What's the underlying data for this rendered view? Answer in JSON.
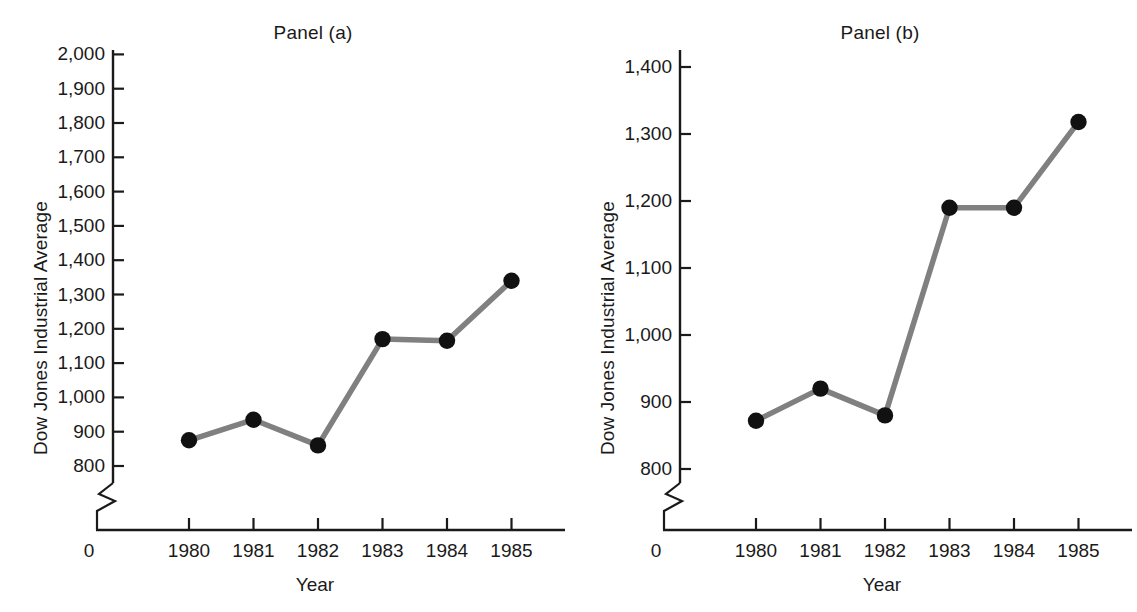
{
  "figure": {
    "background_color": "#ffffff",
    "marker_color": "#111111",
    "line_color": "#808080",
    "axis_color": "#1a1a1a"
  },
  "chart_data": [
    {
      "type": "line",
      "title": "Panel (a)",
      "xlabel": "Year",
      "ylabel": "Dow Jones Industrial Average",
      "categories": [
        "1980",
        "1981",
        "1982",
        "1983",
        "1984",
        "1985"
      ],
      "x": [
        1980,
        1981,
        1982,
        1983,
        1984,
        1985
      ],
      "values": [
        875,
        935,
        860,
        1170,
        1165,
        1340
      ],
      "ylim": [
        800,
        2000
      ],
      "yticks": [
        800,
        900,
        1000,
        1100,
        1200,
        1300,
        1400,
        1500,
        1600,
        1700,
        1800,
        1900,
        2000
      ],
      "ytick_labels": [
        "800",
        "900",
        "1,000",
        "1,100",
        "1,200",
        "1,300",
        "1,400",
        "1,500",
        "1,600",
        "1,700",
        "1,800",
        "1,900",
        "2,000"
      ],
      "origin_label": "0",
      "axis_break": true,
      "grid": false,
      "legend": null
    },
    {
      "type": "line",
      "title": "Panel (b)",
      "xlabel": "Year",
      "ylabel": "Dow Jones Industrial Average",
      "categories": [
        "1980",
        "1981",
        "1982",
        "1983",
        "1984",
        "1985"
      ],
      "x": [
        1980,
        1981,
        1982,
        1983,
        1984,
        1985
      ],
      "values": [
        872,
        920,
        880,
        1190,
        1190,
        1318
      ],
      "ylim": [
        800,
        1400
      ],
      "yticks": [
        800,
        900,
        1000,
        1100,
        1200,
        1300,
        1400
      ],
      "ytick_labels": [
        "800",
        "900",
        "1,000",
        "1,100",
        "1,200",
        "1,300",
        "1,400"
      ],
      "origin_label": "0",
      "axis_break": true,
      "grid": false,
      "legend": null
    }
  ]
}
